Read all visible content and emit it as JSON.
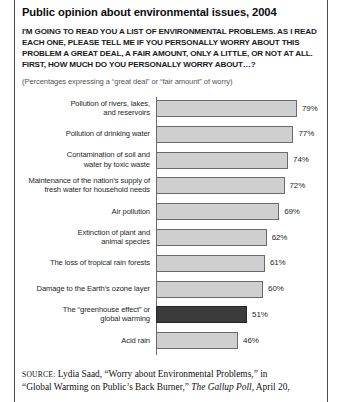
{
  "figure": {
    "title": "Public opinion about environmental issues, 2004",
    "question": "I'M GOING TO READ  YOU A LIST OF ENVIRONMENTAL PROBLEMS. AS I READ EACH ONE, PLEASE TELL ME IF YOU PERSONALLY WORRY ABOUT THIS PROBLEM A GREAT DEAL, A FAIR AMOUNT, ONLY A LITTLE, OR NOT AT ALL. FIRST, HOW MUCH DO YOU PERSONALLY WORRY ABOUT…?",
    "subnote": "(Percentages expressing a “great deal” or “fair amount” of worry)"
  },
  "source": {
    "label": "SOURCE:",
    "line1": " Lydia Saad, “Worry about Environmental Problems,” in",
    "line2_pre": "“Global Warming on Public’s Back Burner,” ",
    "line2_italic": "The Gallup Poll",
    "line2_post": ", April 20,"
  },
  "colors": {
    "bar_fill": "#cfcfcf",
    "bar_stroke": "#6b6b6b",
    "bar_highlight": "#3b3b3b",
    "text": "#1f1f1f"
  },
  "chart_data": {
    "type": "bar",
    "orientation": "horizontal",
    "title": "Public opinion about environmental issues, 2004",
    "xlabel": "",
    "ylabel": "",
    "xlim": [
      0,
      100
    ],
    "grid": false,
    "legend": "none",
    "value_suffix": "%",
    "highlight_category": "The “greenhouse effect” or global warming",
    "categories": [
      "Pollution of rivers, lakes, and reservoirs",
      "Pollution of drinking water",
      "Contamination of soil and water by toxic waste",
      "Maintenance of the nation’s supply of fresh water for household needs",
      "Air pollution",
      "Extinction of plant and animal species",
      "The loss of tropical rain forests",
      "Damage to the  Earth’s ozone layer",
      "The “greenhouse effect” or global warming",
      "Acid rain"
    ],
    "values": [
      79,
      77,
      74,
      72,
      69,
      62,
      61,
      60,
      51,
      46
    ],
    "labels": [
      "79%",
      "77%",
      "74%",
      "72%",
      "69%",
      "62%",
      "61%",
      "60%",
      "51%",
      "46%"
    ],
    "rows": [
      {
        "label_lines": [
          "Pollution of rivers, lakes,",
          "and reservoirs"
        ],
        "value": 79,
        "value_label": "79%",
        "highlight": false
      },
      {
        "label_lines": [
          "Pollution of drinking water"
        ],
        "value": 77,
        "value_label": "77%",
        "highlight": false
      },
      {
        "label_lines": [
          "Contamination of soil and",
          "water by toxic waste"
        ],
        "value": 74,
        "value_label": "74%",
        "highlight": false
      },
      {
        "label_lines": [
          "Maintenance of the nation’s supply of",
          "fresh water for household needs"
        ],
        "value": 72,
        "value_label": "72%",
        "highlight": false
      },
      {
        "label_lines": [
          "Air pollution"
        ],
        "value": 69,
        "value_label": "69%",
        "highlight": false
      },
      {
        "label_lines": [
          "Extinction of plant and",
          "animal species"
        ],
        "value": 62,
        "value_label": "62%",
        "highlight": false
      },
      {
        "label_lines": [
          "The loss of tropical rain forests"
        ],
        "value": 61,
        "value_label": "61%",
        "highlight": false
      },
      {
        "label_lines": [
          "Damage to the  Earth’s ozone layer"
        ],
        "value": 60,
        "value_label": "60%",
        "highlight": false
      },
      {
        "label_lines": [
          "The “greenhouse effect” or",
          "global warming"
        ],
        "value": 51,
        "value_label": "51%",
        "highlight": true
      },
      {
        "label_lines": [
          "Acid rain"
        ],
        "value": 46,
        "value_label": "46%",
        "highlight": false
      }
    ]
  }
}
